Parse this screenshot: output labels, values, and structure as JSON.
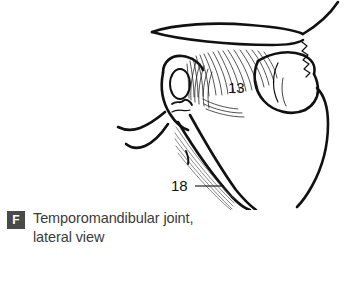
{
  "figure": {
    "badge_letter": "F",
    "caption_line1": "Temporomandibular joint,",
    "caption_line2": "lateral view",
    "background_color": "#ffffff",
    "badge_color": "#4a4a4a",
    "caption_color": "#3b3b3b",
    "line_color": "#111111"
  },
  "illustration": {
    "type": "anatomical-line-drawing",
    "subject": "Temporomandibular joint, lateral view",
    "labels": [
      {
        "id": "label-13",
        "text": "13",
        "x": 228,
        "y": 93,
        "has_leader_line": false,
        "points_to": "temporalis tendon fibers"
      },
      {
        "id": "label-18",
        "text": "18",
        "x": 171,
        "y": 191,
        "has_leader_line": true,
        "leader_x1": 195,
        "leader_x2": 224,
        "leader_y": 186,
        "points_to": "ramus of mandible"
      }
    ]
  }
}
